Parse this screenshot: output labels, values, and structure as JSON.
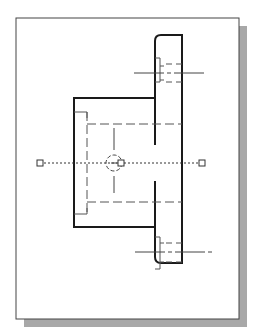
{
  "diagram": {
    "type": "cad-orthographic-view",
    "colors": {
      "background": "#ffffff",
      "sheet": "#ffffff",
      "sheet_border": "#444444",
      "shadow": "#a8a8a8",
      "object_line": "#1a1a1a",
      "hidden_line": "#555555",
      "center_line": "#444444",
      "grip": "#333333"
    },
    "sheet": {
      "x": 16,
      "y": 18,
      "width": 223,
      "height": 301,
      "shadow_offset": 8
    },
    "flange": {
      "x1": 155,
      "y1": 35,
      "x2": 182,
      "y2": 263,
      "corner_radius": 6
    },
    "boss": {
      "x1": 74,
      "y1": 98,
      "x2": 155,
      "y2": 227
    },
    "center_line": {
      "y": 163,
      "x1": 40,
      "x2": 202
    },
    "center_circle": {
      "cx": 114,
      "cy": 163,
      "r": 8
    },
    "grips": [
      {
        "name": "left-grip",
        "x": 40,
        "y": 163
      },
      {
        "name": "center-grip",
        "x": 121,
        "y": 163
      },
      {
        "name": "right-grip",
        "x": 202,
        "y": 163
      }
    ],
    "holes": [
      {
        "name": "top-hole",
        "cy": 73
      },
      {
        "name": "bottom-hole",
        "cy": 252
      }
    ]
  }
}
